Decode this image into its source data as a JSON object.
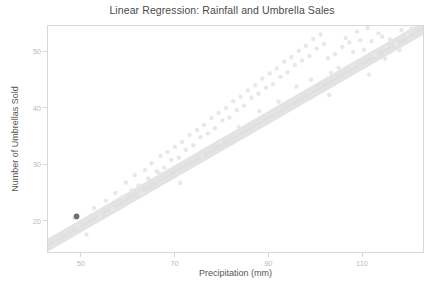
{
  "chart_data": {
    "type": "scatter",
    "title": "Linear Regression: Rainfall and Umbrella Sales",
    "xlabel": "Precipitation (mm)",
    "ylabel": "Number of Umbrellas Sold",
    "xlim": [
      43,
      123
    ],
    "ylim": [
      14.5,
      54.5
    ],
    "xticks": [
      50,
      70,
      90,
      110
    ],
    "yticks": [
      20,
      30,
      40,
      50
    ],
    "grid": false,
    "legend": null,
    "series": [
      {
        "name": "observations",
        "type": "scatter",
        "color": "#e8e8e8",
        "marker_size": 2.2,
        "x": [
          48.6,
          49.4,
          51.2,
          52.8,
          54.1,
          55.3,
          56.7,
          57.4,
          58.9,
          59.6,
          60.8,
          61.5,
          62.3,
          63.7,
          64.4,
          65.1,
          66.2,
          67.0,
          67.8,
          68.5,
          69.3,
          70.1,
          70.9,
          71.6,
          72.4,
          73.2,
          74.0,
          74.8,
          75.5,
          76.3,
          77.1,
          77.9,
          78.6,
          79.4,
          80.2,
          81.0,
          81.7,
          82.5,
          83.3,
          84.1,
          84.8,
          85.6,
          86.4,
          87.2,
          87.9,
          88.7,
          89.5,
          90.3,
          91.0,
          91.8,
          92.6,
          93.4,
          94.1,
          94.9,
          95.7,
          96.5,
          97.2,
          98.0,
          98.8,
          99.6,
          100.3,
          101.1,
          101.9,
          102.7,
          103.4,
          104.2,
          105.0,
          105.8,
          106.5,
          107.3,
          108.1,
          108.9,
          109.6,
          110.4,
          111.2,
          112.0,
          112.7,
          113.5,
          114.3,
          115.1,
          116.0,
          117.2,
          118.4,
          119.6,
          120.5,
          62.9,
          66.8,
          71.2,
          75.9,
          79.9,
          83.7,
          88.1,
          92.2,
          96.0,
          99.1,
          103.0,
          107.8,
          111.5,
          114.9,
          118.0
        ],
        "y": [
          20.5,
          19.1,
          17.6,
          22.3,
          20.9,
          23.6,
          22.1,
          25.0,
          24.2,
          26.8,
          25.4,
          28.1,
          26.3,
          29.0,
          27.5,
          30.2,
          28.8,
          31.5,
          29.4,
          32.2,
          30.8,
          33.1,
          31.2,
          34.0,
          32.6,
          35.2,
          33.4,
          36.1,
          34.8,
          37.0,
          35.5,
          38.2,
          36.4,
          39.1,
          37.8,
          40.0,
          38.3,
          41.2,
          39.6,
          42.0,
          40.4,
          43.1,
          41.8,
          44.0,
          42.5,
          45.2,
          43.6,
          46.1,
          44.2,
          47.0,
          45.5,
          48.2,
          46.3,
          49.0,
          47.6,
          50.1,
          48.4,
          51.0,
          49.2,
          52.2,
          50.5,
          53.0,
          51.3,
          48.8,
          46.2,
          49.5,
          47.1,
          50.8,
          52.4,
          51.6,
          49.9,
          53.5,
          52.0,
          50.3,
          54.1,
          51.8,
          49.4,
          53.2,
          52.6,
          50.9,
          52.1,
          51.4,
          53.8,
          52.9,
          54.0,
          24.9,
          28.4,
          26.7,
          31.3,
          33.9,
          36.6,
          39.4,
          41.1,
          43.8,
          45.0,
          42.3,
          47.4,
          45.9,
          48.7,
          50.2
        ],
        "highlight_point": {
          "x": 49.1,
          "y": 20.8,
          "color": "#6f6f6f",
          "size": 2.8
        }
      },
      {
        "name": "regression band",
        "type": "band",
        "color": "#e3e3e3",
        "x_start": 43.0,
        "x_end": 123.0,
        "y_start_lower": 14.6,
        "y_start_upper": 16.9,
        "y_end_lower": 52.9,
        "y_end_upper": 55.3
      },
      {
        "name": "regression line",
        "type": "line",
        "color": "#dedede",
        "slope": 0.4798,
        "intercept": -4.95
      }
    ]
  }
}
